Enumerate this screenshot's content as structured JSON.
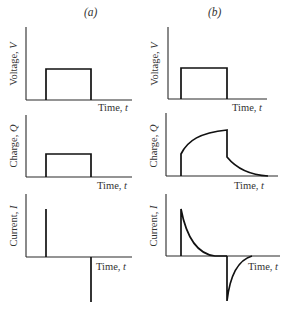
{
  "columns": [
    {
      "label": "(a)"
    },
    {
      "label": "(b)"
    }
  ],
  "rows": [
    {
      "ylabel_text": "Voltage, ",
      "ylabel_var": "V",
      "xlabel_text": "Time, ",
      "xlabel_var": "t"
    },
    {
      "ylabel_text": "Charge, ",
      "ylabel_var": "Q",
      "xlabel_text": "Time, ",
      "xlabel_var": "t"
    },
    {
      "ylabel_text": "Current, ",
      "ylabel_var": "I",
      "xlabel_text": "Time, ",
      "xlabel_var": "t"
    }
  ],
  "colors": {
    "trace": "#111111",
    "axis": "#2a2a2a",
    "text": "#333333",
    "background": "#ffffff"
  },
  "panels": {
    "a_voltage": "rectangular pulse",
    "a_charge": "rectangular pulse",
    "a_current": "positive spike at pulse start, negative spike at pulse end",
    "b_voltage": "rectangular pulse",
    "b_charge": "exponential rise during pulse, exponential decay after",
    "b_current": "exponential decaying positive spike, exponential decaying negative spike"
  }
}
